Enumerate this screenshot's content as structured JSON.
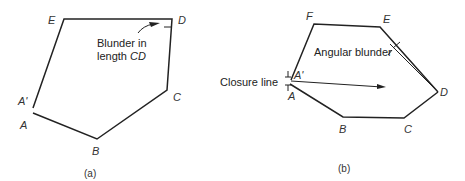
{
  "panel_a": {
    "caption": "(a)",
    "vertices": {
      "E": "E",
      "D": "D",
      "C": "C",
      "B": "B",
      "A": "A",
      "A_prime": "A'"
    },
    "annotation_line1": "Blunder in",
    "annotation_line2_prefix": "length ",
    "annotation_line2_italic": "CD"
  },
  "panel_b": {
    "caption": "(b)",
    "vertices": {
      "F": "F",
      "E": "E",
      "D": "D",
      "C": "C",
      "B": "B",
      "A": "A",
      "A_prime": "A'"
    },
    "angular_label": "Angular blunder",
    "closure_label": "Closure line"
  }
}
